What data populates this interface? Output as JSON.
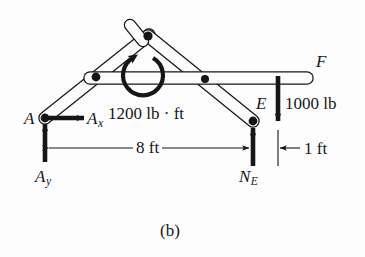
{
  "figure": {
    "caption": "(b)",
    "kind": "free-body-diagram",
    "ink_color": "#15161a",
    "background_color": "#fdfdfd"
  },
  "labels": {
    "point_a": "A",
    "reaction_ax_base": "A",
    "reaction_ax_sub": "x",
    "reaction_ay_base": "A",
    "reaction_ay_sub": "y",
    "point_e": "E",
    "point_f": "F",
    "reaction_ne_base": "N",
    "reaction_ne_sub": "E"
  },
  "loads": {
    "couple_moment": "1200 lb · ft",
    "vertical_force": "1000 lb"
  },
  "dimensions": {
    "span": "8 ft",
    "overhang": "1 ft"
  },
  "geometry": {
    "point_a": {
      "x": 45,
      "y": 118
    },
    "apex": {
      "x": 148,
      "y": 36
    },
    "point_e": {
      "x": 253,
      "y": 121
    },
    "point_f": {
      "x": 307,
      "y": 72
    },
    "pin_left": {
      "x": 96,
      "y": 76
    },
    "pin_right": {
      "x": 205,
      "y": 78
    }
  }
}
